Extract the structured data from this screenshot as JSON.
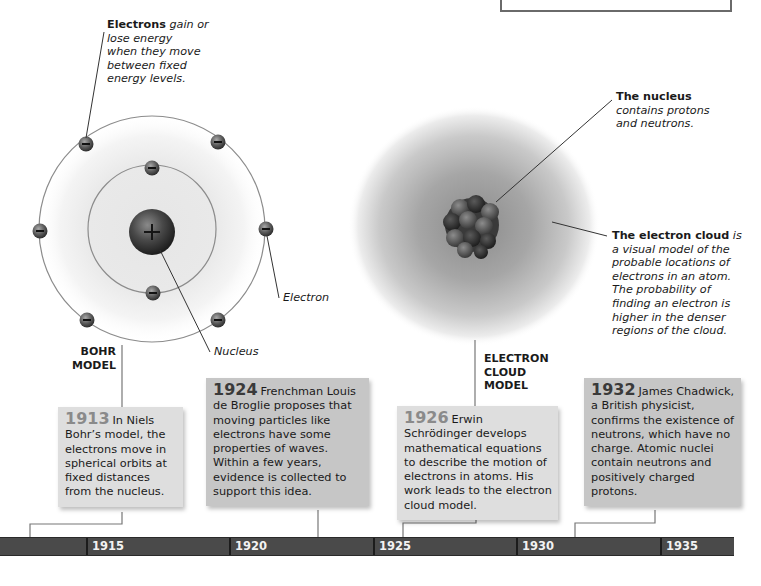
{
  "bohr_model": {
    "label_line1": "BOHR",
    "label_line2": "MODEL",
    "callout_electrons": {
      "bold": "Electrons",
      "italic_1": "gain or",
      "italic_2": "lose energy",
      "italic_3": "when they move",
      "italic_4": "between fixed",
      "italic_5": "energy levels."
    },
    "label_electron": "Electron",
    "label_nucleus": "Nucleus",
    "nucleus_symbol": "+",
    "electron_symbol": "−"
  },
  "cloud_model": {
    "label_line1": "ELECTRON",
    "label_line2": "CLOUD",
    "label_line3": "MODEL",
    "callout_nucleus": {
      "bold": "The nucleus",
      "italic_1": "contains protons",
      "italic_2": "and neutrons."
    },
    "callout_cloud": {
      "bold": "The electron cloud",
      "italic_0": "is",
      "italic_1": "a visual model of the",
      "italic_2": "probable locations of",
      "italic_3": "electrons in an atom.",
      "italic_4": "The probability of",
      "italic_5": "finding an electron is",
      "italic_6": "higher in the denser",
      "italic_7": "regions of the cloud."
    }
  },
  "events": [
    {
      "year": "1913",
      "text": "In Niels Bohr’s model, the electrons move in spherical orbits at fixed distances from the nucleus."
    },
    {
      "year": "1924",
      "text": "Frenchman Louis de Broglie proposes that moving particles like electrons have some properties of waves. Within a few years, evidence is collected to support this idea."
    },
    {
      "year": "1926",
      "text": "Erwin Schrödinger develops mathematical equations to describe the motion of electrons in atoms. His work leads to the electron cloud model."
    },
    {
      "year": "1932",
      "text": "James Chadwick, a British physicist, confirms the existence of neutrons, which have no charge. Atomic nuclei contain neutrons and positively charged protons."
    }
  ],
  "timeline": {
    "ticks": [
      "1915",
      "1920",
      "1925",
      "1930",
      "1935"
    ]
  },
  "colors": {
    "timeline_bar": "#4a4a4a",
    "box_light": "#dedede",
    "box_dark": "#c6c6c6",
    "line": "#555555"
  }
}
